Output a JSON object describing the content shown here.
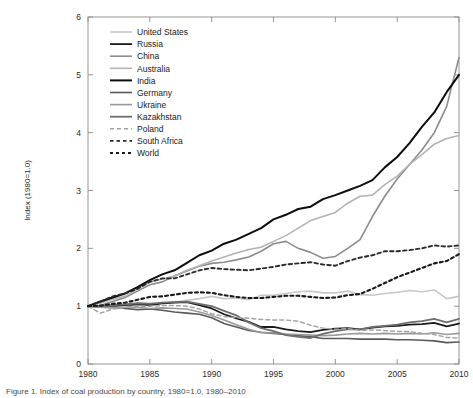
{
  "figure": {
    "caption": "Figure 1. Index of coal production by country, 1980=1.0, 1980–2010"
  },
  "chart_data": {
    "type": "line",
    "title": "",
    "xlabel": "",
    "ylabel": "Index (1980=1.0)",
    "xlim": [
      1980,
      2010
    ],
    "ylim": [
      0,
      6
    ],
    "xticks": [
      1980,
      1985,
      1990,
      1995,
      2000,
      2005,
      2010
    ],
    "yticks": [
      0,
      1,
      2,
      3,
      4,
      5,
      6
    ],
    "grid": false,
    "legend_position": "upper left",
    "x": [
      1980,
      1981,
      1982,
      1983,
      1984,
      1985,
      1986,
      1987,
      1988,
      1989,
      1990,
      1991,
      1992,
      1993,
      1994,
      1995,
      1996,
      1997,
      1998,
      1999,
      2000,
      2001,
      2002,
      2003,
      2004,
      2005,
      2006,
      2007,
      2008,
      2009,
      2010
    ],
    "series": [
      {
        "name": "United States",
        "color": "#c8c8c8",
        "width": 1.6,
        "dash": "none",
        "values": [
          1.0,
          0.98,
          0.97,
          0.96,
          1.06,
          1.05,
          1.05,
          1.07,
          1.1,
          1.13,
          1.17,
          1.13,
          1.14,
          1.11,
          1.19,
          1.19,
          1.22,
          1.25,
          1.26,
          1.23,
          1.23,
          1.26,
          1.2,
          1.19,
          1.22,
          1.24,
          1.27,
          1.25,
          1.28,
          1.13,
          1.17
        ]
      },
      {
        "name": "Russia",
        "color": "#1a1a1a",
        "width": 1.8,
        "dash": "none",
        "values": [
          1.0,
          0.99,
          1.0,
          1.02,
          1.03,
          1.02,
          1.05,
          1.06,
          1.07,
          1.02,
          0.96,
          0.86,
          0.79,
          0.73,
          0.64,
          0.64,
          0.6,
          0.57,
          0.55,
          0.59,
          0.61,
          0.62,
          0.6,
          0.63,
          0.65,
          0.66,
          0.68,
          0.69,
          0.71,
          0.65,
          0.7
        ]
      },
      {
        "name": "China",
        "color": "#8c8c8c",
        "width": 1.6,
        "dash": "none",
        "values": [
          1.0,
          1.01,
          1.08,
          1.15,
          1.26,
          1.37,
          1.42,
          1.52,
          1.61,
          1.69,
          1.74,
          1.76,
          1.8,
          1.85,
          1.95,
          2.08,
          2.12,
          2.0,
          1.93,
          1.83,
          1.86,
          2.0,
          2.15,
          2.55,
          2.9,
          3.2,
          3.45,
          3.7,
          4.0,
          4.45,
          5.3
        ]
      },
      {
        "name": "Australia",
        "color": "#b4b4b4",
        "width": 1.6,
        "dash": "none",
        "values": [
          1.0,
          1.05,
          1.12,
          1.17,
          1.3,
          1.42,
          1.47,
          1.52,
          1.62,
          1.7,
          1.78,
          1.85,
          1.92,
          1.98,
          2.02,
          2.12,
          2.22,
          2.35,
          2.48,
          2.55,
          2.62,
          2.78,
          2.9,
          2.92,
          3.1,
          3.25,
          3.45,
          3.62,
          3.8,
          3.9,
          3.95
        ]
      },
      {
        "name": "India",
        "color": "#0d0d0d",
        "width": 2.0,
        "dash": "none",
        "values": [
          1.0,
          1.08,
          1.15,
          1.22,
          1.33,
          1.45,
          1.55,
          1.62,
          1.75,
          1.88,
          1.96,
          2.08,
          2.15,
          2.25,
          2.35,
          2.5,
          2.58,
          2.68,
          2.72,
          2.85,
          2.92,
          3.0,
          3.08,
          3.18,
          3.4,
          3.58,
          3.82,
          4.1,
          4.35,
          4.7,
          5.0
        ]
      },
      {
        "name": "Germany",
        "color": "#5a5a5a",
        "width": 1.6,
        "dash": "none",
        "values": [
          1.0,
          1.0,
          0.99,
          0.96,
          0.94,
          0.95,
          0.93,
          0.9,
          0.88,
          0.86,
          0.8,
          0.7,
          0.64,
          0.58,
          0.55,
          0.53,
          0.51,
          0.49,
          0.47,
          0.44,
          0.44,
          0.44,
          0.43,
          0.43,
          0.43,
          0.42,
          0.42,
          0.41,
          0.4,
          0.37,
          0.38
        ]
      },
      {
        "name": "Ukraine",
        "color": "#9a9a9a",
        "width": 1.6,
        "dash": "none",
        "values": [
          1.0,
          0.98,
          0.97,
          0.98,
          0.98,
          0.96,
          0.97,
          0.96,
          0.95,
          0.9,
          0.84,
          0.76,
          0.68,
          0.6,
          0.54,
          0.54,
          0.52,
          0.51,
          0.5,
          0.49,
          0.5,
          0.52,
          0.53,
          0.52,
          0.53,
          0.52,
          0.53,
          0.52,
          0.54,
          0.51,
          0.53
        ]
      },
      {
        "name": "Kazakhstan",
        "color": "#6e6e6e",
        "width": 1.8,
        "dash": "none",
        "values": [
          1.0,
          1.0,
          1.02,
          1.03,
          1.05,
          1.04,
          1.06,
          1.07,
          1.08,
          1.04,
          1.0,
          0.92,
          0.84,
          0.72,
          0.62,
          0.57,
          0.5,
          0.47,
          0.45,
          0.52,
          0.57,
          0.6,
          0.6,
          0.64,
          0.66,
          0.68,
          0.72,
          0.74,
          0.78,
          0.72,
          0.78
        ]
      },
      {
        "name": "Poland",
        "color": "#a5a5a5",
        "width": 1.5,
        "dash": "4,3",
        "values": [
          1.0,
          0.88,
          0.95,
          0.98,
          1.0,
          1.0,
          1.01,
          1.01,
          1.0,
          0.95,
          0.87,
          0.82,
          0.8,
          0.79,
          0.77,
          0.76,
          0.76,
          0.74,
          0.67,
          0.62,
          0.6,
          0.61,
          0.58,
          0.59,
          0.58,
          0.56,
          0.56,
          0.53,
          0.51,
          0.46,
          0.45
        ]
      },
      {
        "name": "South Africa",
        "color": "#2b2b2b",
        "width": 1.9,
        "dash": "3.5,3",
        "values": [
          1.0,
          1.08,
          1.17,
          1.22,
          1.3,
          1.42,
          1.48,
          1.48,
          1.55,
          1.62,
          1.66,
          1.64,
          1.63,
          1.62,
          1.65,
          1.68,
          1.72,
          1.74,
          1.76,
          1.72,
          1.7,
          1.78,
          1.84,
          1.88,
          1.95,
          1.95,
          1.97,
          2.0,
          2.05,
          2.03,
          2.05
        ]
      },
      {
        "name": "World",
        "color": "#1a1a1a",
        "width": 2.1,
        "dash": "3,3",
        "values": [
          1.0,
          1.01,
          1.04,
          1.06,
          1.11,
          1.16,
          1.17,
          1.2,
          1.23,
          1.24,
          1.23,
          1.19,
          1.16,
          1.14,
          1.14,
          1.16,
          1.18,
          1.18,
          1.16,
          1.14,
          1.15,
          1.19,
          1.21,
          1.3,
          1.4,
          1.5,
          1.58,
          1.66,
          1.74,
          1.78,
          1.9
        ]
      }
    ]
  },
  "legend": {
    "items": [
      {
        "label": "United States"
      },
      {
        "label": "Russia"
      },
      {
        "label": "China"
      },
      {
        "label": "Australia"
      },
      {
        "label": "India"
      },
      {
        "label": "Germany"
      },
      {
        "label": "Ukraine"
      },
      {
        "label": "Kazakhstan"
      },
      {
        "label": "Poland"
      },
      {
        "label": "South Africa"
      },
      {
        "label": "World"
      }
    ]
  }
}
